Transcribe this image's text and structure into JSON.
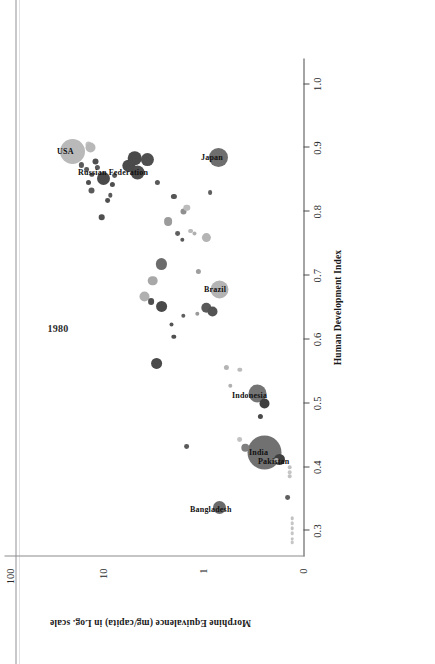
{
  "figure": {
    "orientation": "rotated-90-ccw",
    "year_annotation": "1980",
    "page_edge": true
  },
  "chart_data": {
    "type": "scatter",
    "title": "",
    "xlabel": "Human Development Index",
    "ylabel": "Morphine Equivalence (mg/capita) in Log. scale",
    "xlim": [
      0.26,
      1.04
    ],
    "ylim_labels": [
      "0",
      "1",
      "10",
      "100"
    ],
    "xticks": [
      0.3,
      0.4,
      0.5,
      0.6,
      0.7,
      0.8,
      0.9,
      1.0
    ],
    "xtick_labels": [
      "0.3",
      "0.4",
      "0.5",
      "0.6",
      "0.7",
      "0.8",
      "0.9",
      "1.0"
    ],
    "yticks": [
      0,
      1,
      10,
      100
    ],
    "ytick_labels": [
      "0",
      "1",
      "10",
      "100"
    ],
    "grid": false,
    "legend": false,
    "annotation": "1980",
    "size_encodes": "population",
    "color_encodes": "region",
    "colors": {
      "dark": "#4d4d4d",
      "mid": "#7a7a7a",
      "light": "#b4b4b4",
      "pale": "#cfcfcf",
      "axis": "#4a4a4a",
      "text": "#1a1a1a"
    },
    "labeled_points": [
      {
        "name": "USA",
        "hdi": 0.895,
        "me": 21.0,
        "r": 12.5,
        "color": "#b9b9b9"
      },
      {
        "name": "Russian Federation",
        "hdi": 0.862,
        "me": 4.0,
        "r": 7.0,
        "color": "#4d4d4d"
      },
      {
        "name": "Japan",
        "hdi": 0.885,
        "me": 0.52,
        "r": 9.5,
        "color": "#6e6e6e"
      },
      {
        "name": "Brazil",
        "hdi": 0.678,
        "me": 0.5,
        "r": 9.0,
        "color": "#b4b4b4"
      },
      {
        "name": "India",
        "hdi": 0.423,
        "me": 0.16,
        "r": 17.0,
        "color": "#717171"
      },
      {
        "name": "Pakistan",
        "hdi": 0.412,
        "me": 0.11,
        "r": 5.5,
        "color": "#3f3f3f"
      },
      {
        "name": "Bangladesh",
        "hdi": 0.336,
        "me": 0.5,
        "r": 6.5,
        "color": "#6a6a6a"
      },
      {
        "name": "Indonesia",
        "hdi": 0.515,
        "me": 0.19,
        "r": 9.0,
        "color": "#747474"
      }
    ],
    "points": [
      {
        "hdi": 0.895,
        "me": 21.0,
        "r": 12.5,
        "color": "#b9b9b9"
      },
      {
        "hdi": 0.906,
        "me": 14.0,
        "r": 3.0,
        "color": "#c2c2c2"
      },
      {
        "hdi": 0.901,
        "me": 13.2,
        "r": 5.0,
        "color": "#b8b8b8"
      },
      {
        "hdi": 0.873,
        "me": 16.5,
        "r": 2.6,
        "color": "#5a5a5a"
      },
      {
        "hdi": 0.866,
        "me": 14.5,
        "r": 2.4,
        "color": "#5a5a5a"
      },
      {
        "hdi": 0.878,
        "me": 11.5,
        "r": 3.0,
        "color": "#4f4f4f"
      },
      {
        "hdi": 0.869,
        "me": 11.0,
        "r": 2.6,
        "color": "#5a5a5a"
      },
      {
        "hdi": 0.858,
        "me": 12.8,
        "r": 2.2,
        "color": "#555555"
      },
      {
        "hdi": 0.845,
        "me": 14.0,
        "r": 2.5,
        "color": "#4f4f4f"
      },
      {
        "hdi": 0.852,
        "me": 9.5,
        "r": 6.5,
        "color": "#4a4a4a"
      },
      {
        "hdi": 0.862,
        "me": 4.0,
        "r": 7.0,
        "color": "#4d4d4d"
      },
      {
        "hdi": 0.872,
        "me": 5.0,
        "r": 6.2,
        "color": "#4a4a4a"
      },
      {
        "hdi": 0.884,
        "me": 4.3,
        "r": 6.8,
        "color": "#4a4a4a"
      },
      {
        "hdi": 0.882,
        "me": 3.1,
        "r": 6.6,
        "color": "#4f4f4f"
      },
      {
        "hdi": 0.842,
        "me": 7.5,
        "r": 2.6,
        "color": "#4f4f4f"
      },
      {
        "hdi": 0.857,
        "me": 7.2,
        "r": 2.4,
        "color": "#595959"
      },
      {
        "hdi": 0.834,
        "me": 13.0,
        "r": 3.0,
        "color": "#5a5a5a"
      },
      {
        "hdi": 0.818,
        "me": 8.6,
        "r": 2.4,
        "color": "#4f4f4f"
      },
      {
        "hdi": 0.826,
        "me": 8.0,
        "r": 2.2,
        "color": "#5a5a5a"
      },
      {
        "hdi": 0.846,
        "me": 2.4,
        "r": 2.6,
        "color": "#5a5a5a"
      },
      {
        "hdi": 0.824,
        "me": 1.6,
        "r": 2.6,
        "color": "#555555"
      },
      {
        "hdi": 0.83,
        "me": 0.64,
        "r": 2.4,
        "color": "#5f5f5f"
      },
      {
        "hdi": 0.885,
        "me": 0.52,
        "r": 9.5,
        "color": "#6e6e6e"
      },
      {
        "hdi": 0.791,
        "me": 10.0,
        "r": 2.8,
        "color": "#4f4f4f"
      },
      {
        "hdi": 0.785,
        "me": 1.85,
        "r": 4.4,
        "color": "#9b9b9b"
      },
      {
        "hdi": 0.8,
        "me": 1.25,
        "r": 3.0,
        "color": "#8f8f8f"
      },
      {
        "hdi": 0.806,
        "me": 1.15,
        "r": 3.2,
        "color": "#bcbcbc"
      },
      {
        "hdi": 0.77,
        "me": 1.05,
        "r": 2.4,
        "color": "#b9b9b9"
      },
      {
        "hdi": 0.766,
        "me": 0.95,
        "r": 2.0,
        "color": "#b0b0b0"
      },
      {
        "hdi": 0.76,
        "me": 0.7,
        "r": 4.6,
        "color": "#b4b4b4"
      },
      {
        "hdi": 0.766,
        "me": 1.45,
        "r": 2.4,
        "color": "#5f5f5f"
      },
      {
        "hdi": 0.756,
        "me": 1.3,
        "r": 2.2,
        "color": "#5a5a5a"
      },
      {
        "hdi": 0.718,
        "me": 2.2,
        "r": 5.6,
        "color": "#6c6c6c"
      },
      {
        "hdi": 0.706,
        "me": 0.86,
        "r": 2.6,
        "color": "#9e9e9e"
      },
      {
        "hdi": 0.692,
        "me": 2.75,
        "r": 4.8,
        "color": "#a8a8a8"
      },
      {
        "hdi": 0.678,
        "me": 0.5,
        "r": 9.0,
        "color": "#b4b4b4"
      },
      {
        "hdi": 0.668,
        "me": 3.35,
        "r": 5.0,
        "color": "#b0b0b0"
      },
      {
        "hdi": 0.66,
        "me": 2.85,
        "r": 3.4,
        "color": "#4f4f4f"
      },
      {
        "hdi": 0.652,
        "me": 2.2,
        "r": 5.4,
        "color": "#4a4a4a"
      },
      {
        "hdi": 0.65,
        "me": 0.7,
        "r": 5.2,
        "color": "#5a5a5a"
      },
      {
        "hdi": 0.637,
        "me": 1.25,
        "r": 2.2,
        "color": "#5f5f5f"
      },
      {
        "hdi": 0.644,
        "me": 0.6,
        "r": 5.0,
        "color": "#535353"
      },
      {
        "hdi": 0.64,
        "me": 0.88,
        "r": 2.2,
        "color": "#9a9a9a"
      },
      {
        "hdi": 0.624,
        "me": 1.7,
        "r": 2.0,
        "color": "#555555"
      },
      {
        "hdi": 0.604,
        "me": 1.6,
        "r": 2.2,
        "color": "#4f4f4f"
      },
      {
        "hdi": 0.562,
        "me": 2.45,
        "r": 5.4,
        "color": "#4a4a4a"
      },
      {
        "hdi": 0.556,
        "me": 0.42,
        "r": 2.6,
        "color": "#b4b4b4"
      },
      {
        "hdi": 0.553,
        "me": 0.3,
        "r": 2.2,
        "color": "#bcbcbc"
      },
      {
        "hdi": 0.528,
        "me": 0.38,
        "r": 2.2,
        "color": "#b0b0b0"
      },
      {
        "hdi": 0.515,
        "me": 0.19,
        "r": 9.0,
        "color": "#747474"
      },
      {
        "hdi": 0.499,
        "me": 0.16,
        "r": 5.0,
        "color": "#3f3f3f"
      },
      {
        "hdi": 0.479,
        "me": 0.18,
        "r": 2.6,
        "color": "#4a4a4a"
      },
      {
        "hdi": 0.443,
        "me": 0.3,
        "r": 2.4,
        "color": "#c2c2c2"
      },
      {
        "hdi": 0.432,
        "me": 1.15,
        "r": 2.4,
        "color": "#5a5a5a"
      },
      {
        "hdi": 0.423,
        "me": 0.16,
        "r": 17.0,
        "color": "#717171"
      },
      {
        "hdi": 0.43,
        "me": 0.26,
        "r": 4.2,
        "color": "#7f7f7f"
      },
      {
        "hdi": 0.412,
        "me": 0.11,
        "r": 5.5,
        "color": "#3f3f3f"
      },
      {
        "hdi": 0.41,
        "me": 0.12,
        "r": 2.6,
        "color": "#a8a8a8"
      },
      {
        "hdi": 0.336,
        "me": 0.5,
        "r": 6.5,
        "color": "#6a6a6a"
      },
      {
        "hdi": 0.4,
        "me": 0.085,
        "r": 1.8,
        "color": "#c2c2c2"
      },
      {
        "hdi": 0.392,
        "me": 0.085,
        "r": 1.8,
        "color": "#c6c6c6"
      },
      {
        "hdi": 0.386,
        "me": 0.085,
        "r": 1.8,
        "color": "#c2c2c2"
      },
      {
        "hdi": 0.352,
        "me": 0.09,
        "r": 2.4,
        "color": "#5f5f5f"
      },
      {
        "hdi": 0.32,
        "me": 0.08,
        "r": 1.8,
        "color": "#c2c2c2"
      },
      {
        "hdi": 0.312,
        "me": 0.08,
        "r": 1.8,
        "color": "#c6c6c6"
      },
      {
        "hdi": 0.304,
        "me": 0.08,
        "r": 1.8,
        "color": "#c2c2c2"
      },
      {
        "hdi": 0.296,
        "me": 0.08,
        "r": 1.8,
        "color": "#c6c6c6"
      },
      {
        "hdi": 0.288,
        "me": 0.08,
        "r": 1.8,
        "color": "#c2c2c2"
      },
      {
        "hdi": 0.282,
        "me": 0.08,
        "r": 1.8,
        "color": "#c6c6c6"
      }
    ]
  }
}
